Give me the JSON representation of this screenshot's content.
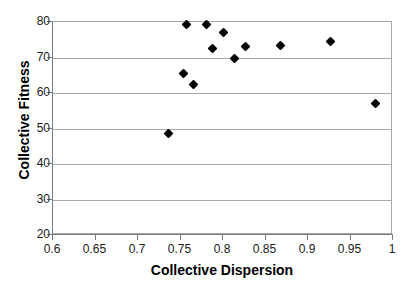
{
  "chart_data": {
    "type": "scatter",
    "title": "",
    "xlabel": "Collective Dispersion",
    "ylabel": "Collective Fitness",
    "xlim": [
      0.6,
      1.0
    ],
    "ylim": [
      20,
      80
    ],
    "grid": true,
    "legend": null,
    "x_ticks": [
      "0.6",
      "0.65",
      "0.7",
      "0.75",
      "0.8",
      "0.85",
      "0.9",
      "0.95",
      "1"
    ],
    "x_tick_values": [
      0.6,
      0.65,
      0.7,
      0.75,
      0.8,
      0.85,
      0.9,
      0.95,
      1.0
    ],
    "y_ticks": [
      "80",
      "70",
      "60",
      "50",
      "40",
      "30",
      "20"
    ],
    "y_tick_values": [
      80,
      70,
      60,
      50,
      40,
      30,
      20
    ],
    "marker": "filled-diamond",
    "marker_color": "#000000",
    "points": [
      {
        "x": 0.736,
        "y": 48.6
      },
      {
        "x": 0.754,
        "y": 65.6
      },
      {
        "x": 0.757,
        "y": 79.2
      },
      {
        "x": 0.765,
        "y": 62.4
      },
      {
        "x": 0.781,
        "y": 79.2
      },
      {
        "x": 0.788,
        "y": 72.5
      },
      {
        "x": 0.8,
        "y": 77.0
      },
      {
        "x": 0.813,
        "y": 69.8
      },
      {
        "x": 0.827,
        "y": 73.0
      },
      {
        "x": 0.868,
        "y": 73.4
      },
      {
        "x": 0.927,
        "y": 74.4
      },
      {
        "x": 0.979,
        "y": 57.0
      }
    ]
  }
}
